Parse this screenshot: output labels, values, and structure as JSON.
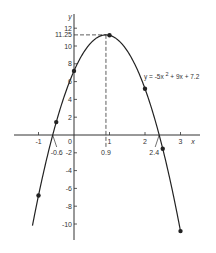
{
  "chart_data": {
    "type": "line",
    "title": "",
    "equation": "y = -5x² + 9x + 7.2",
    "equation_label": {
      "prefix": "y = -5x",
      "sup": "2",
      "suffix": " + 9x + 7.2"
    },
    "xlabel": "x",
    "ylabel": "y",
    "xlim": [
      -1.3,
      3.5
    ],
    "ylim": [
      -12,
      13
    ],
    "x_ticks": [
      -1,
      0,
      1,
      2,
      3
    ],
    "x_tick_labels": [
      "-1",
      "0",
      "1",
      "2",
      "3"
    ],
    "y_ticks": [
      -10,
      -8,
      -6,
      -4,
      -2,
      2,
      4,
      6,
      8,
      10,
      12
    ],
    "y_tick_labels": [
      "-10",
      "-8",
      "-6",
      "-4",
      "-2",
      "2",
      "4",
      "6",
      "8",
      "10",
      "12"
    ],
    "grid": false,
    "series": [
      {
        "name": "y = -5x^2 + 9x + 7.2",
        "points": [
          {
            "x": -1,
            "y": -6.8
          },
          {
            "x": -0.5,
            "y": 1.45
          },
          {
            "x": 0,
            "y": 7.2
          },
          {
            "x": 1,
            "y": 11.2
          },
          {
            "x": 2,
            "y": 5.2
          },
          {
            "x": 2.5,
            "y": -1.55
          },
          {
            "x": 3,
            "y": -10.8
          }
        ]
      }
    ],
    "annotations": [
      {
        "type": "vertex",
        "x": 0.9,
        "y": 11.25,
        "x_label": "0.9",
        "y_label": "11.25"
      },
      {
        "type": "root",
        "x": -0.6,
        "label": "-0.6"
      },
      {
        "type": "root",
        "x": 2.4,
        "label": "2.4"
      }
    ]
  },
  "labels": {
    "y_axis": "y",
    "x_axis": "x",
    "origin": "0",
    "vertex_x": "0.9",
    "vertex_y": "11.25",
    "root_left": "-0.6",
    "root_right": "2.4"
  }
}
